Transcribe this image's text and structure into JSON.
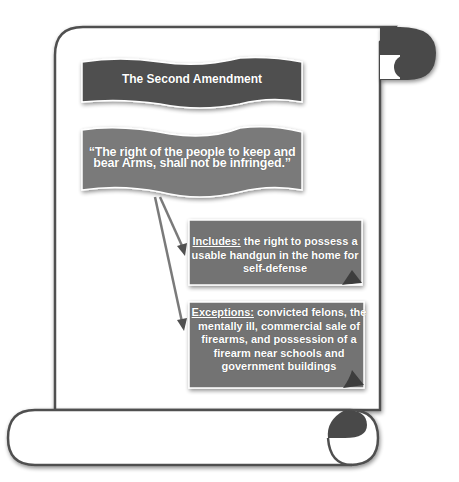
{
  "colors": {
    "title_box": "#505050",
    "quote_box": "#7a7a7a",
    "detail_box": "#737373",
    "scroll_outline": "#505050",
    "scroll_curl": "#4a4a4a",
    "arrow": "#7a7a7a"
  },
  "title": "The Second Amendment",
  "quote": {
    "line1": "“The right of the people to keep and",
    "line2": "bear Arms, shall not be infringed.”"
  },
  "includes": {
    "label": "Includes:",
    "text": " the right to possess a usable handgun in the home for self-defense"
  },
  "exceptions": {
    "label": "Exceptions:",
    "text": " convicted felons, the mentally ill, commercial sale of firearms, and possession of a firearm near schools and government buildings"
  },
  "arrows": [
    {
      "from": "quote",
      "to": "includes"
    },
    {
      "from": "quote",
      "to": "exceptions"
    }
  ]
}
